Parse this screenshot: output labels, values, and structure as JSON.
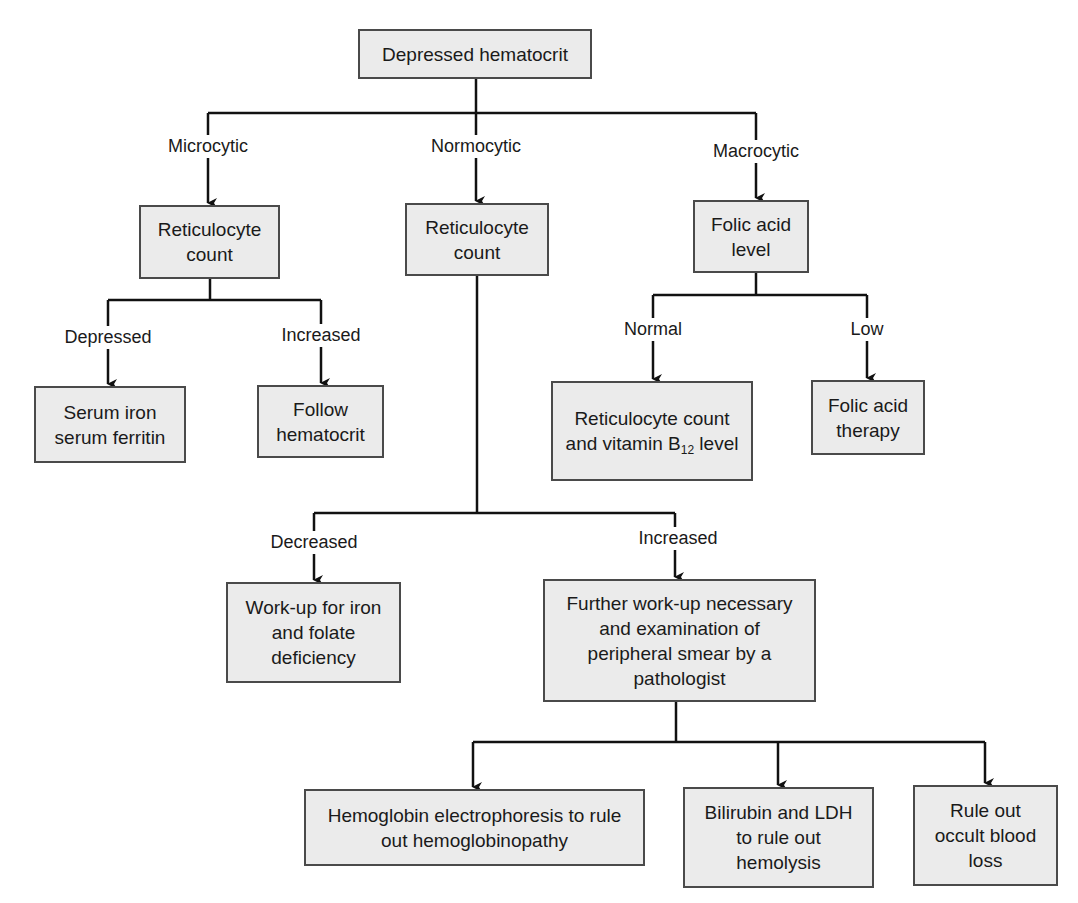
{
  "diagram": {
    "type": "flowchart",
    "colors": {
      "node_fill": "#ebebeb",
      "node_border": "#4a4a4a",
      "line": "#111111",
      "background": "#ffffff"
    },
    "nodes": {
      "root": {
        "text": "Depressed hematocrit"
      },
      "micro_retic": {
        "text": "Reticulocyte count"
      },
      "normo_retic": {
        "text": "Reticulocyte count"
      },
      "folic_level": {
        "text": "Folic acid level"
      },
      "serum_iron": {
        "text": "Serum iron serum ferritin"
      },
      "follow_hct": {
        "text": "Follow hematocrit"
      },
      "retic_b12": {
        "text_pre": "Reticulocyte count and vitamin B",
        "text_sub": "12",
        "text_post": " level"
      },
      "folic_therapy": {
        "text": "Folic acid therapy"
      },
      "workup_iron": {
        "text": "Work-up for iron and folate deficiency"
      },
      "further_workup": {
        "text": "Further work-up necessary and examination of peripheral smear by a pathologist"
      },
      "hb_electro": {
        "text": "Hemoglobin electrophoresis to rule out hemoglobinopathy"
      },
      "bilirubin_ldh": {
        "text": "Bilirubin and LDH to rule out hemolysis"
      },
      "occult_blood": {
        "text": "Rule out occult blood loss"
      }
    },
    "edge_labels": {
      "microcytic": "Microcytic",
      "normocytic": "Normocytic",
      "macrocytic": "Macrocytic",
      "micro_depressed": "Depressed",
      "micro_increased": "Increased",
      "folic_normal": "Normal",
      "folic_low": "Low",
      "normo_decreased": "Decreased",
      "normo_increased": "Increased"
    },
    "edges": [
      [
        "root",
        "micro_retic",
        "Microcytic"
      ],
      [
        "root",
        "normo_retic",
        "Normocytic"
      ],
      [
        "root",
        "folic_level",
        "Macrocytic"
      ],
      [
        "micro_retic",
        "serum_iron",
        "Depressed"
      ],
      [
        "micro_retic",
        "follow_hct",
        "Increased"
      ],
      [
        "folic_level",
        "retic_b12",
        "Normal"
      ],
      [
        "folic_level",
        "folic_therapy",
        "Low"
      ],
      [
        "normo_retic",
        "workup_iron",
        "Decreased"
      ],
      [
        "normo_retic",
        "further_workup",
        "Increased"
      ],
      [
        "further_workup",
        "hb_electro",
        ""
      ],
      [
        "further_workup",
        "bilirubin_ldh",
        ""
      ],
      [
        "further_workup",
        "occult_blood",
        ""
      ]
    ]
  }
}
